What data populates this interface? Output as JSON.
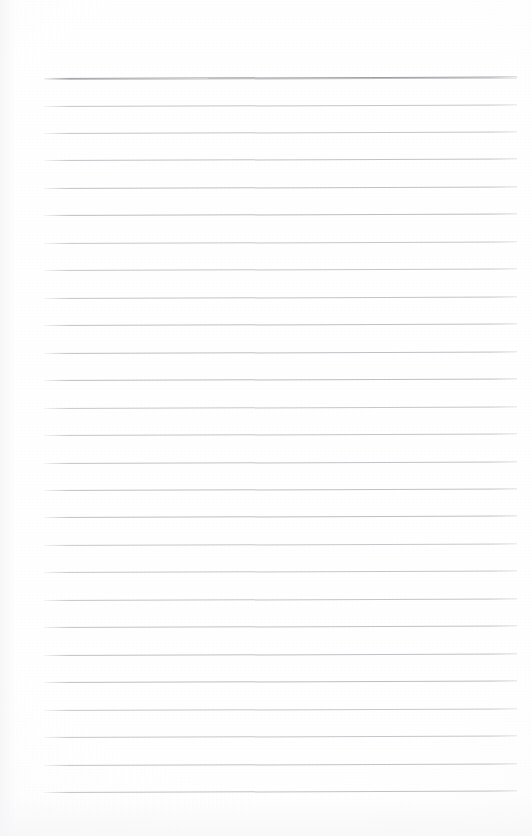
{
  "document": {
    "kind": "lined-notepad-page",
    "title": "Lined Notepad Page",
    "description": "Blank scanned ruled writing paper with horizontal rules and no written content",
    "page_width": 532,
    "page_height": 836,
    "background_color": "#fefefe",
    "written_text": "",
    "visible_text_items": []
  },
  "ruling": {
    "line_count": 27,
    "line_color": "#bdbdc2",
    "header_line_color": "#9d9da2",
    "header_line_index": 0,
    "line_left_x": 44,
    "line_right_x": 517,
    "line_width": 473,
    "first_line_y": 78,
    "line_spacing": 27.45,
    "skew_degrees": -0.17,
    "lines_y": [
      78,
      105.5,
      133,
      160.4,
      187.9,
      215.3,
      242.8,
      270.3,
      297.7,
      325.2,
      352.6,
      380.1,
      407.6,
      435,
      462.5,
      489.9,
      517.4,
      544.9,
      572.3,
      599.8,
      627.2,
      654.7,
      682.2,
      709.6,
      737.1,
      764.5,
      792
    ]
  },
  "margins": {
    "top_margin_height": 78,
    "bottom_margin_height": 44,
    "left_margin_width": 44,
    "right_margin_width": 15
  }
}
